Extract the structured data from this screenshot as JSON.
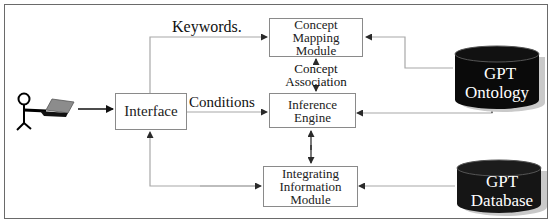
{
  "diagram": {
    "actor": {
      "name": "User",
      "icon": "stick-figure-with-laptop"
    },
    "nodes": {
      "interface": {
        "label": "Interface"
      },
      "concept_mapping": {
        "lines": [
          "Concept",
          "Mapping",
          "Module"
        ]
      },
      "inference_engine": {
        "lines": [
          "Inference",
          "Engine"
        ]
      },
      "integrating_info": {
        "lines": [
          "Integrating",
          "Information",
          "Module"
        ]
      },
      "gpt_ontology": {
        "lines": [
          "GPT",
          "Ontology"
        ]
      },
      "gpt_database": {
        "lines": [
          "GPT",
          "Database"
        ]
      }
    },
    "edge_labels": {
      "keywords": "Keywords.",
      "conditions": "Conditions",
      "concept_association": [
        "Concept",
        "Association"
      ]
    },
    "edges": [
      {
        "from": "user",
        "to": "interface"
      },
      {
        "from": "interface",
        "to": "concept_mapping",
        "label": "Keywords."
      },
      {
        "from": "interface",
        "to": "inference_engine",
        "label": "Conditions"
      },
      {
        "from": "concept_mapping",
        "to": "inference_engine",
        "label": "Concept Association",
        "bidirectional": true
      },
      {
        "from": "inference_engine",
        "to": "integrating_info",
        "bidirectional": true
      },
      {
        "from": "integrating_info",
        "to": "interface",
        "bidirectional": true
      },
      {
        "from": "gpt_ontology",
        "to": "concept_mapping"
      },
      {
        "from": "gpt_ontology",
        "to": "inference_engine"
      },
      {
        "from": "gpt_database",
        "to": "integrating_info"
      }
    ],
    "colors": {
      "frame": "#6a6a6a",
      "box_border": "#8a8a8a",
      "connector": "#a8a8a8",
      "cylinder_fill": "#0a0a0a",
      "cylinder_shadow": "#c8c8c8",
      "cylinder_text": "#ffffff"
    }
  }
}
